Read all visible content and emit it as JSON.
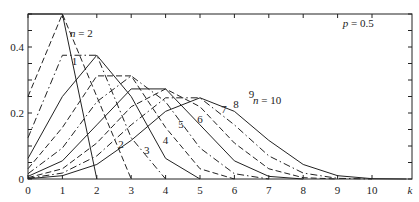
{
  "chart_data": {
    "type": "line",
    "title": "",
    "annotation": "p = 0.5",
    "xlabel": "k",
    "ylabel": "",
    "xlim": [
      0,
      10.8
    ],
    "ylim": [
      0,
      0.5
    ],
    "x_ticks": [
      "0",
      "1",
      "2",
      "3",
      "4",
      "5",
      "6",
      "7",
      "8",
      "9",
      "10"
    ],
    "y_ticks": [
      "0",
      "0.2",
      "0.4"
    ],
    "series": [
      {
        "name": "n = 1",
        "x": [
          0,
          1
        ],
        "values": [
          0.5,
          0.5
        ]
      },
      {
        "name": "n = 2",
        "x": [
          0,
          1,
          2
        ],
        "values": [
          0.25,
          0.5,
          0.25
        ]
      },
      {
        "name": "n = 3",
        "x": [
          0,
          1,
          2,
          3
        ],
        "values": [
          0.125,
          0.375,
          0.375,
          0.125
        ]
      },
      {
        "name": "n = 4",
        "x": [
          0,
          1,
          2,
          3,
          4
        ],
        "values": [
          0.0625,
          0.25,
          0.375,
          0.25,
          0.0625
        ]
      },
      {
        "name": "n = 5",
        "x": [
          0,
          1,
          2,
          3,
          4,
          5
        ],
        "values": [
          0.031,
          0.156,
          0.3125,
          0.3125,
          0.156,
          0.031
        ]
      },
      {
        "name": "n = 6",
        "x": [
          0,
          1,
          2,
          3,
          4,
          5,
          6
        ],
        "values": [
          0.016,
          0.094,
          0.234,
          0.3125,
          0.234,
          0.094,
          0.016
        ]
      },
      {
        "name": "n = 7",
        "x": [
          0,
          1,
          2,
          3,
          4,
          5,
          6,
          7
        ],
        "values": [
          0.008,
          0.055,
          0.164,
          0.273,
          0.273,
          0.164,
          0.055,
          0.008
        ]
      },
      {
        "name": "n = 8",
        "x": [
          0,
          1,
          2,
          3,
          4,
          5,
          6,
          7,
          8
        ],
        "values": [
          0.004,
          0.031,
          0.109,
          0.219,
          0.273,
          0.219,
          0.109,
          0.031,
          0.004
        ]
      },
      {
        "name": "n = 9",
        "x": [
          0,
          1,
          2,
          3,
          4,
          5,
          6,
          7,
          8,
          9
        ],
        "values": [
          0.002,
          0.018,
          0.07,
          0.164,
          0.246,
          0.246,
          0.164,
          0.07,
          0.018,
          0.002
        ]
      },
      {
        "name": "n = 10",
        "x": [
          0,
          1,
          2,
          3,
          4,
          5,
          6,
          7,
          8,
          9,
          10
        ],
        "values": [
          0.001,
          0.01,
          0.044,
          0.117,
          0.205,
          0.246,
          0.205,
          0.117,
          0.044,
          0.01,
          0.001
        ]
      }
    ],
    "curve_labels": [
      {
        "text": "n = 2",
        "x": 1.55,
        "y": 0.43
      },
      {
        "text": "1",
        "x": 1.35,
        "y": 0.345
      },
      {
        "text": "2",
        "x": 2.7,
        "y": 0.095
      },
      {
        "text": "3",
        "x": 3.45,
        "y": 0.075
      },
      {
        "text": "4",
        "x": 4.0,
        "y": 0.105
      },
      {
        "text": "5",
        "x": 4.45,
        "y": 0.155
      },
      {
        "text": "6",
        "x": 5.0,
        "y": 0.17
      },
      {
        "text": "7",
        "x": 5.7,
        "y": 0.2
      },
      {
        "text": "8",
        "x": 6.05,
        "y": 0.215
      },
      {
        "text": "9",
        "x": 6.5,
        "y": 0.245
      },
      {
        "text": "n = 10",
        "x": 6.95,
        "y": 0.228
      }
    ]
  }
}
